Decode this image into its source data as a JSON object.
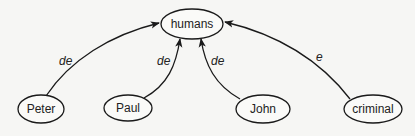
{
  "diagram": {
    "type": "semantic-network",
    "nodes": {
      "humans": {
        "label": "humans",
        "cx": 192,
        "cy": 24,
        "rx": 31,
        "ry": 15
      },
      "peter": {
        "label": "Peter",
        "cx": 41,
        "cy": 109,
        "rx": 23,
        "ry": 14
      },
      "paul": {
        "label": "Paul",
        "cx": 128,
        "cy": 108,
        "rx": 24,
        "ry": 13
      },
      "john": {
        "label": "John",
        "cx": 263,
        "cy": 109,
        "rx": 27,
        "ry": 14
      },
      "criminal": {
        "label": "criminal",
        "cx": 373,
        "cy": 109,
        "rx": 29,
        "ry": 14
      }
    },
    "edges": [
      {
        "from": "Peter",
        "to": "humans",
        "label": "de"
      },
      {
        "from": "Paul",
        "to": "humans",
        "label": "de"
      },
      {
        "from": "John",
        "to": "humans",
        "label": "de"
      },
      {
        "from": "criminal",
        "to": "humans",
        "label": "e"
      }
    ],
    "edge_labels": {
      "peter_humans": "de",
      "paul_humans": "de",
      "john_humans": "de",
      "criminal_humans": "e"
    },
    "colors": {
      "background": "#f6f6f4",
      "stroke": "#1a1a1a",
      "text": "#222222"
    }
  }
}
